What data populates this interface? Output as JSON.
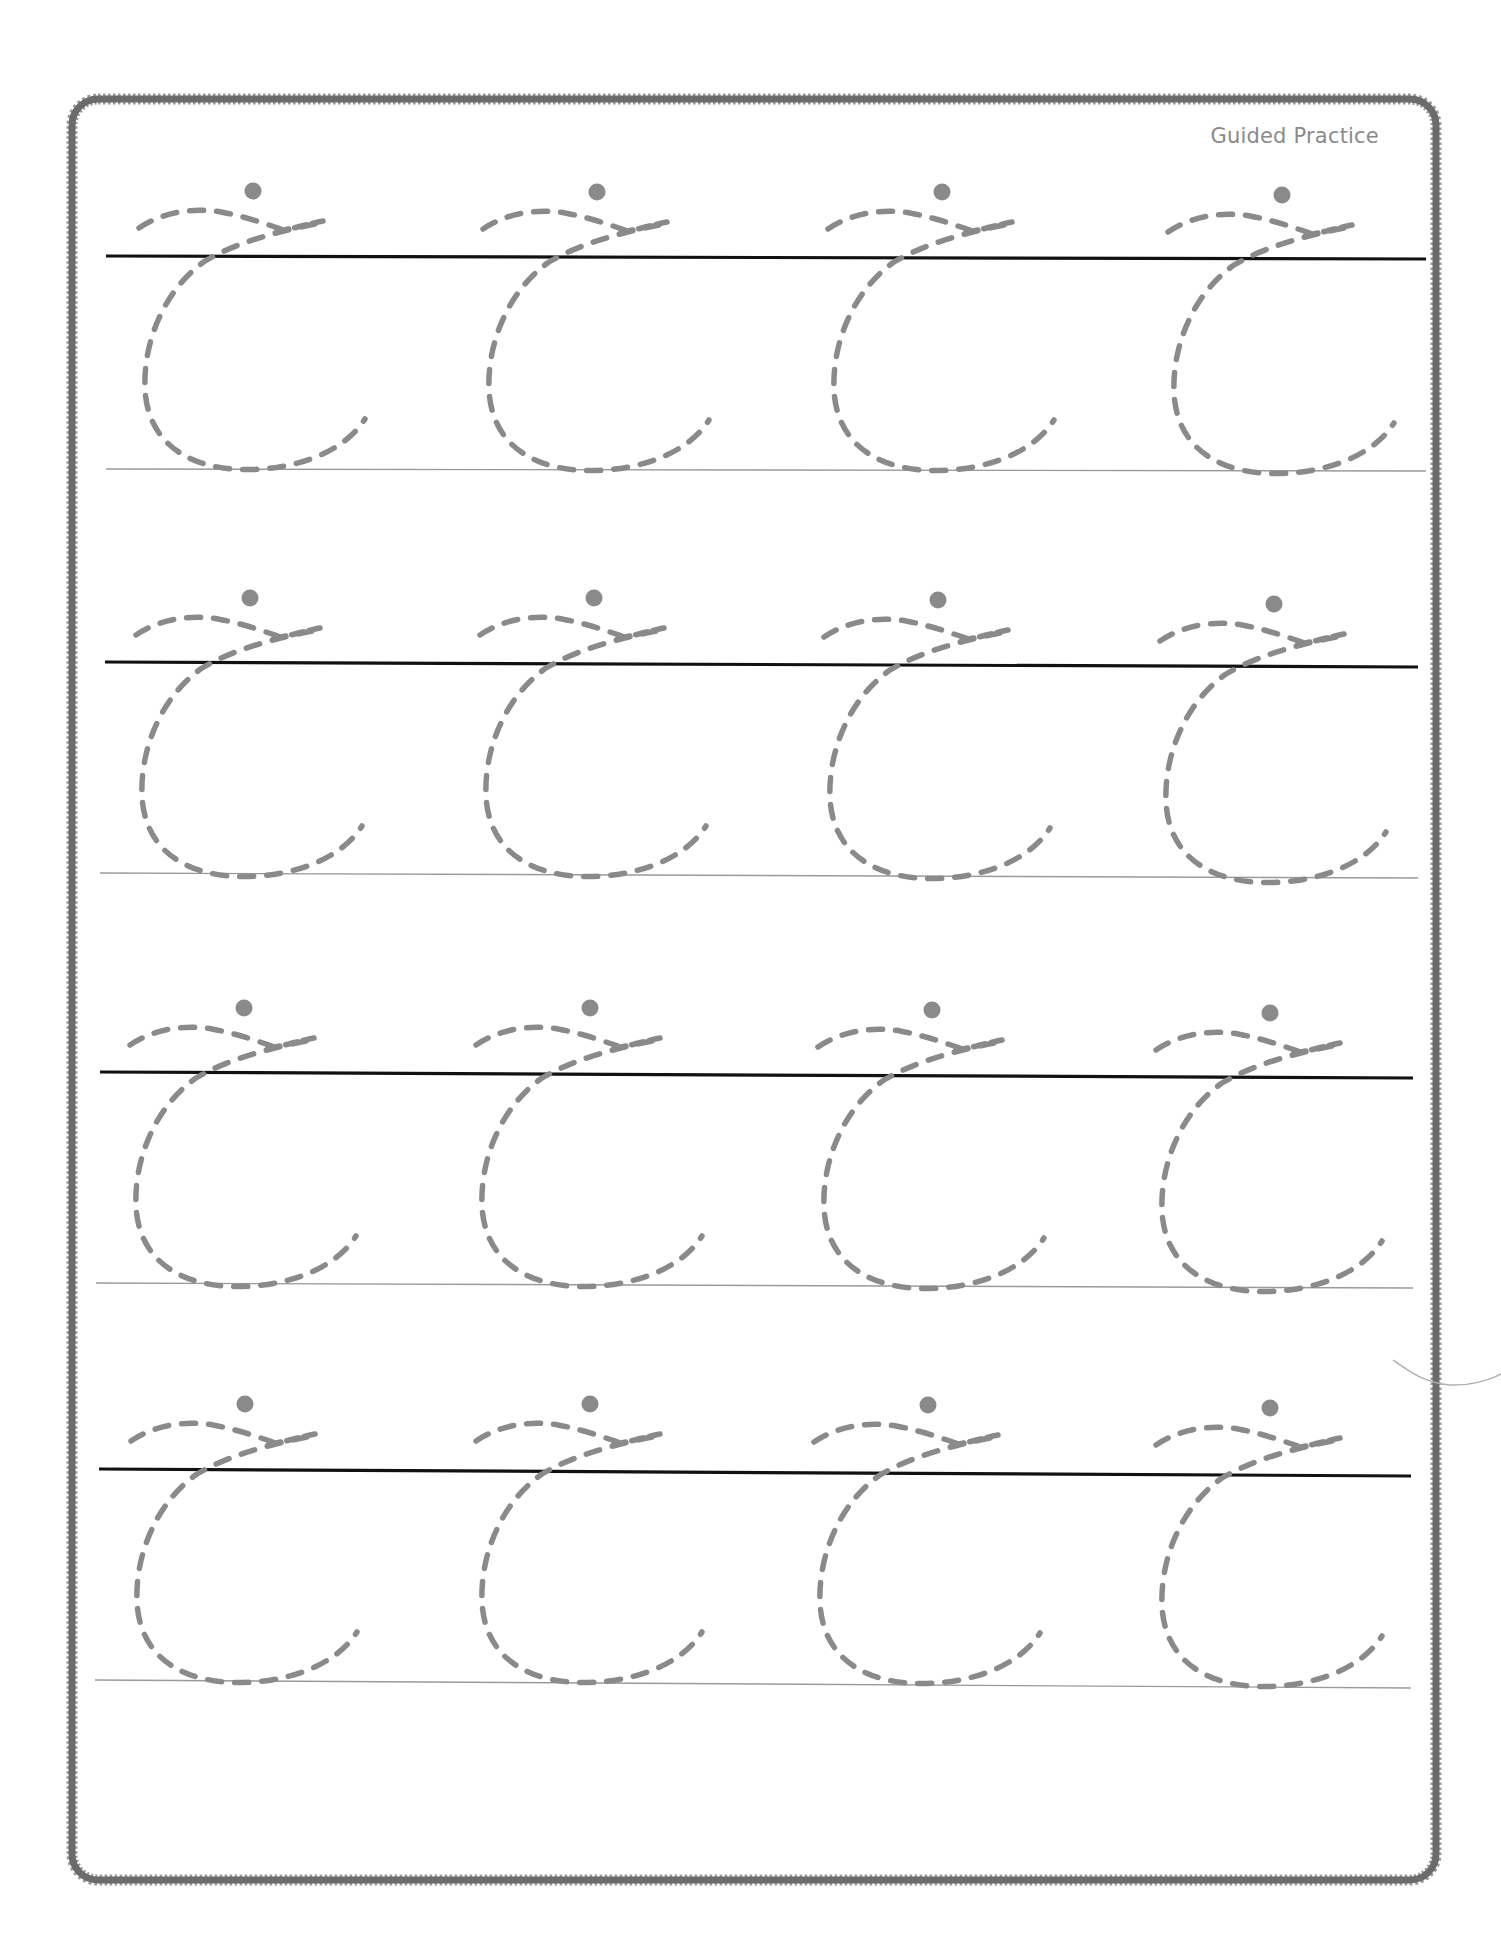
{
  "worksheet": {
    "title": "Guided Practice",
    "letter": "c",
    "letter_style": "cursive lowercase, dashed tracing guide with start dot",
    "rows": 4,
    "columns": 4,
    "colors": {
      "border": "#6b6b6b",
      "trace_stroke": "#8a8a8a",
      "start_dot": "#8a8a8a",
      "headline": "#111111",
      "baseline": "#9a9a9a",
      "title": "#8a8a8a"
    },
    "guide_rows": [
      {
        "headline": {
          "x1": 106,
          "y1": 256,
          "x2": 1426,
          "y2": 259
        },
        "baseline": {
          "x1": 106,
          "y1": 469,
          "x2": 1426,
          "y2": 471
        },
        "dots_y": [
          191,
          192,
          192,
          195
        ]
      },
      {
        "headline": {
          "x1": 105,
          "y1": 662,
          "x2": 1418,
          "y2": 667
        },
        "baseline": {
          "x1": 100,
          "y1": 873,
          "x2": 1418,
          "y2": 878
        },
        "dots_y": [
          598,
          598,
          600,
          604
        ]
      },
      {
        "headline": {
          "x1": 100,
          "y1": 1072,
          "x2": 1413,
          "y2": 1078
        },
        "baseline": {
          "x1": 96,
          "y1": 1283,
          "x2": 1413,
          "y2": 1288
        },
        "dots_y": [
          1008,
          1008,
          1010,
          1013
        ]
      },
      {
        "headline": {
          "x1": 99,
          "y1": 1469,
          "x2": 1411,
          "y2": 1476
        },
        "baseline": {
          "x1": 95,
          "y1": 1680,
          "x2": 1411,
          "y2": 1688
        },
        "dots_y": [
          1404,
          1404,
          1405,
          1408
        ]
      }
    ],
    "dots_x": [
      [
        253,
        597,
        942,
        1282
      ],
      [
        250,
        594,
        938,
        1274
      ],
      [
        244,
        590,
        932,
        1270
      ],
      [
        245,
        590,
        928,
        1270
      ]
    ]
  }
}
